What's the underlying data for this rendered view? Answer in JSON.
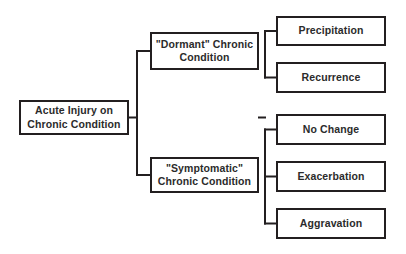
{
  "diagram": {
    "background_color": "#ffffff",
    "box_border_color": "#231f20",
    "text_color": "#2b2b2b",
    "connector_color": "#231f20",
    "nodes": [
      {
        "id": "root",
        "label": "Acute Injury on\nChronic Condition",
        "x": 19,
        "y": 100,
        "w": 110,
        "h": 35,
        "level": 0
      },
      {
        "id": "dormant",
        "label": "\"Dormant\" Chronic\nCondition",
        "x": 150,
        "y": 32,
        "w": 109,
        "h": 38,
        "level": 1
      },
      {
        "id": "symptomatic",
        "label": "\"Symptomatic\"\nChronic Condition",
        "x": 150,
        "y": 157,
        "w": 109,
        "h": 36,
        "level": 1
      },
      {
        "id": "precipitation",
        "label": "Precipitation",
        "x": 276,
        "y": 16,
        "w": 110,
        "h": 30,
        "level": 2
      },
      {
        "id": "recurrence",
        "label": "Recurrence",
        "x": 276,
        "y": 62,
        "w": 110,
        "h": 31,
        "level": 2
      },
      {
        "id": "no-change",
        "label": "No Change",
        "x": 276,
        "y": 114,
        "w": 110,
        "h": 31,
        "level": 2
      },
      {
        "id": "exacerbation",
        "label": "Exacerbation",
        "x": 276,
        "y": 161,
        "w": 110,
        "h": 31,
        "level": 2
      },
      {
        "id": "aggravation",
        "label": "Aggravation",
        "x": 276,
        "y": 208,
        "w": 110,
        "h": 31,
        "level": 2
      }
    ],
    "connectors": {
      "stroke_width": 2,
      "paths": [
        "M129,117.5 L137,117.5",
        "M137,51 L137,175",
        "M137,51 L150,51",
        "M137,175 L150,175",
        "M259,117.5 L265,117.5",
        "M265,31 L265,77.5",
        "M265,31 L276,31",
        "M265,77.5 L276,77.5",
        "M265,129.5 L265,223.5",
        "M265,129.5 L276,129.5",
        "M265,176.5 L276,176.5",
        "M265,223.5 L276,223.5"
      ]
    },
    "edges": [
      {
        "from": "root",
        "to": "dormant"
      },
      {
        "from": "root",
        "to": "symptomatic"
      },
      {
        "from": "dormant",
        "to": "precipitation"
      },
      {
        "from": "dormant",
        "to": "recurrence"
      },
      {
        "from": "symptomatic",
        "to": "no-change"
      },
      {
        "from": "symptomatic",
        "to": "exacerbation"
      },
      {
        "from": "symptomatic",
        "to": "aggravation"
      }
    ]
  }
}
